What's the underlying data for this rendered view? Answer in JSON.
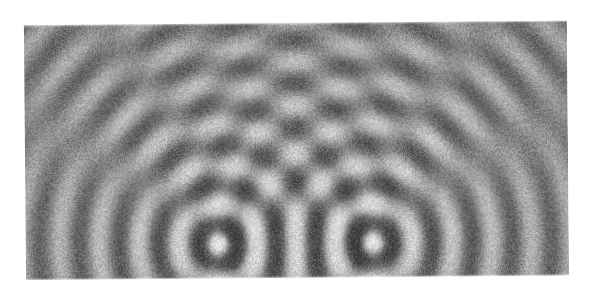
{
  "figure": {
    "kind": "ripple-tank-photograph",
    "background_color": "#ffffff",
    "has_text_labels": false,
    "has_axes": false,
    "has_legend": false
  },
  "photo": {
    "x": 25,
    "y": 23,
    "width": 543,
    "height": 255,
    "tint_color": "#8c8c8c",
    "min_gray": "#1c1c1c",
    "max_gray": "#f2f2f2",
    "grain": "film-grain",
    "skew_deg": -0.5
  },
  "chart_data": {
    "type": "heatmap",
    "xlabel": "",
    "ylabel": "",
    "colormap": "grayscale",
    "grid": false,
    "legend_position": "none",
    "model": "sum of two circular sine waves with radial amplitude decay plus additive film grain",
    "sources": [
      {
        "name": "source-left",
        "x": 218,
        "y": 243,
        "phase_deg": 0,
        "amplitude": 1.0
      },
      {
        "name": "source-right",
        "x": 371,
        "y": 243,
        "phase_deg": 0,
        "amplitude": 1.0
      }
    ],
    "source_separation_px": 153,
    "wavelength_px": 39.5,
    "decay_length_px": 330,
    "decay_exponent": 0.55,
    "grain_amplitude": 0.115,
    "contrast": 0.86,
    "brightness": 0.5,
    "nodal_line_count": 8,
    "antinodal_line_count": 9,
    "visible_ring_orders": [
      1,
      2,
      3,
      4,
      5,
      6,
      7,
      8,
      9,
      10,
      11,
      12
    ],
    "x": [
      25,
      568
    ],
    "ylim": [
      23,
      278
    ]
  }
}
